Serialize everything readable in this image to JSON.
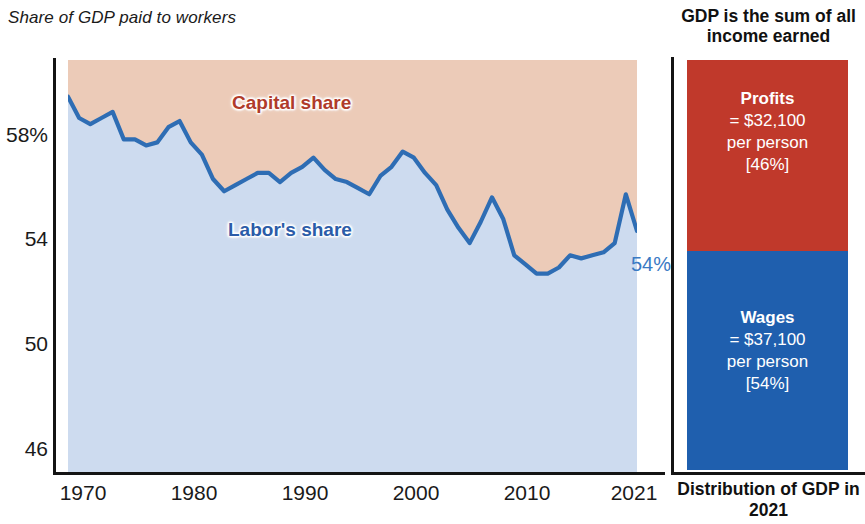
{
  "chart_title": "Share of GDP paid to workers",
  "left_chart": {
    "label_capital": "Capital share",
    "label_labor": "Labor's share",
    "endpoint_value": "54%",
    "y_ticks": [
      "58%",
      "54",
      "50",
      "46"
    ],
    "x_ticks": [
      "1970",
      "1980",
      "1990",
      "2000",
      "2010",
      "2021"
    ]
  },
  "right_panel": {
    "title": "GDP is the sum of all income earned",
    "profits": {
      "heading": "Profits",
      "line2": "= $32,100",
      "line3": "per person",
      "line4": "[46%]"
    },
    "wages": {
      "heading": "Wages",
      "line2": "= $37,100",
      "line3": "per person",
      "line4": "[54%]"
    },
    "footer": "Distribution of GDP in 2021"
  },
  "colors": {
    "capital_fill": "#eccbb8",
    "labor_fill": "#cddbef",
    "line": "#2e6db4",
    "profits_block": "#c0392b",
    "wages_block": "#1f5fae",
    "capital_label": "#b03b2a",
    "labor_label": "#2b5ca8",
    "axis": "#141414"
  },
  "chart_data": {
    "type": "area",
    "title": "Share of GDP paid to workers",
    "xlabel": "",
    "ylabel": "Percent of GDP",
    "xlim": [
      1970,
      2021
    ],
    "ylim": [
      46,
      59.5
    ],
    "grid": false,
    "legend": "inline-band-labels",
    "annotations": [
      {
        "text": "Capital share",
        "note": "upper band, area above the line"
      },
      {
        "text": "Labor's share",
        "note": "lower band, area under the line"
      },
      {
        "text": "54%",
        "x": 2021,
        "y": 53.9,
        "note": "endpoint label right of last point"
      }
    ],
    "x": [
      1970,
      1971,
      1972,
      1973,
      1974,
      1975,
      1976,
      1977,
      1978,
      1979,
      1980,
      1981,
      1982,
      1983,
      1984,
      1985,
      1986,
      1987,
      1988,
      1989,
      1990,
      1991,
      1992,
      1993,
      1994,
      1995,
      1996,
      1997,
      1998,
      1999,
      2000,
      2001,
      2002,
      2003,
      2004,
      2005,
      2006,
      2007,
      2008,
      2009,
      2010,
      2011,
      2012,
      2013,
      2014,
      2015,
      2016,
      2017,
      2018,
      2019,
      2020,
      2021
    ],
    "series": [
      {
        "name": "Labor's share",
        "values": [
          58.3,
          57.6,
          57.4,
          57.6,
          57.8,
          56.9,
          56.9,
          56.7,
          56.8,
          57.3,
          57.5,
          56.8,
          56.4,
          55.6,
          55.2,
          55.4,
          55.6,
          55.8,
          55.8,
          55.5,
          55.8,
          56.0,
          56.3,
          55.9,
          55.6,
          55.5,
          55.3,
          55.1,
          55.7,
          56.0,
          56.5,
          56.3,
          55.8,
          55.4,
          54.6,
          54.0,
          53.5,
          54.2,
          55.0,
          54.3,
          53.1,
          52.8,
          52.5,
          52.5,
          52.7,
          53.1,
          53.0,
          53.1,
          53.2,
          53.5,
          55.1,
          53.9
        ]
      },
      {
        "name": "Capital share",
        "note": "complement of labor's share; shown as the shaded region above the line",
        "values": [
          41.7,
          42.4,
          42.6,
          42.4,
          42.2,
          43.1,
          43.1,
          43.3,
          43.2,
          42.7,
          42.5,
          43.2,
          43.6,
          44.4,
          44.8,
          44.6,
          44.4,
          44.2,
          44.2,
          44.5,
          44.2,
          44.0,
          43.7,
          44.1,
          44.4,
          44.5,
          44.7,
          44.9,
          44.3,
          44.0,
          43.5,
          43.7,
          44.2,
          44.6,
          45.4,
          46.0,
          46.5,
          45.8,
          45.0,
          45.7,
          46.9,
          47.2,
          47.5,
          47.5,
          47.3,
          46.9,
          47.0,
          46.9,
          46.8,
          46.5,
          44.9,
          46.1
        ]
      }
    ]
  },
  "distribution_2021": {
    "type": "stacked-bar",
    "title": "GDP is the sum of all income earned",
    "footer": "Distribution of GDP in 2021",
    "segments": [
      {
        "name": "Profits",
        "amount_per_person": "$32,100",
        "share_pct": 46
      },
      {
        "name": "Wages",
        "amount_per_person": "$37,100",
        "share_pct": 54
      }
    ]
  }
}
